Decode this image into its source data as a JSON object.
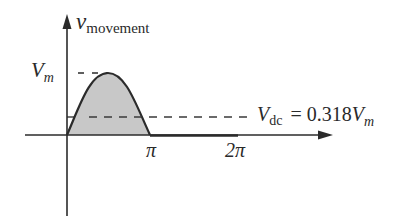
{
  "diagram": {
    "y_axis_label": {
      "main": "v",
      "sub": "movement"
    },
    "peak_label": {
      "main": "V",
      "sub": "m"
    },
    "dc_label": {
      "main": "V",
      "sub": "dc",
      "equals": "= 0.318",
      "tail_main": "V",
      "tail_sub": "m"
    },
    "x_ticks": [
      "π",
      "2π"
    ],
    "colors": {
      "line": "#2b2b2b",
      "fill": "#c8c8c8",
      "background": "#ffffff"
    }
  }
}
